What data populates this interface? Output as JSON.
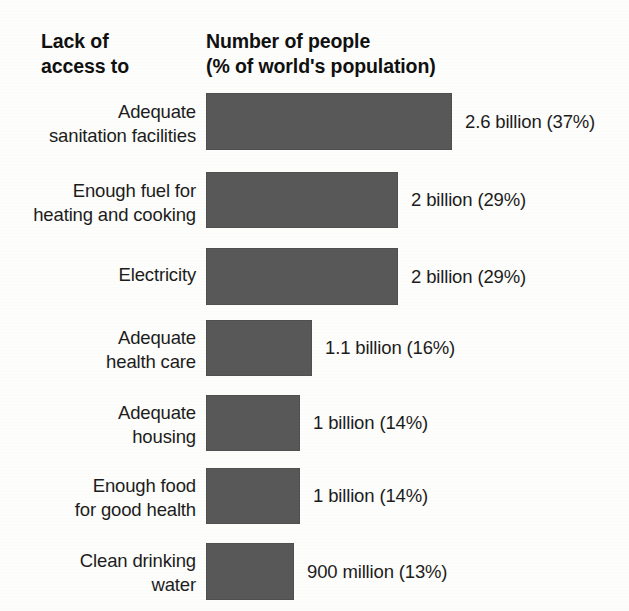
{
  "headers": {
    "left": "Lack of\naccess to",
    "right": "Number of people\n(% of world's population)"
  },
  "colors": {
    "bar": "#585858",
    "background": "#fdfdfb",
    "text": "#1c1c1c"
  },
  "chart_data": {
    "type": "bar",
    "orientation": "horizontal",
    "title": "Lack of access to",
    "xlabel": "Number of people (% of world's population)",
    "ylabel": "Lack of access to",
    "grid": false,
    "legend": null,
    "xlim": [
      0,
      3.0
    ],
    "value_unit": "billions of people",
    "categories": [
      "Adequate\nsanitation facilities",
      "Enough fuel for\nheating and cooking",
      "Electricity",
      "Adequate\nhealth care",
      "Adequate\nhousing",
      "Enough food\nfor good health",
      "Clean drinking\nwater"
    ],
    "values": [
      2.6,
      2.0,
      2.0,
      1.1,
      1.0,
      1.0,
      0.9
    ],
    "percents": [
      37,
      29,
      29,
      16,
      14,
      14,
      13
    ],
    "data_labels": [
      "2.6 billion (37%)",
      "2 billion (29%)",
      "2 billion (29%)",
      "1.1 billion (16%)",
      "1 billion (14%)",
      "1 billion (14%)",
      "900 million (13%)"
    ]
  },
  "rows": [
    {
      "label": "Adequate\nsanitation facilities",
      "value_label": "2.6 billion (37%)",
      "bar_width": 246,
      "top": 93,
      "height": 57,
      "label_top": 100
    },
    {
      "label": "Enough fuel for\nheating and cooking",
      "value_label": "2 billion (29%)",
      "bar_width": 192,
      "top": 172,
      "height": 56,
      "label_top": 179
    },
    {
      "label": "Electricity",
      "value_label": "2 billion (29%)",
      "bar_width": 192,
      "top": 248,
      "height": 57,
      "label_top": 263
    },
    {
      "label": "Adequate\nhealth care",
      "value_label": "1.1 billion (16%)",
      "bar_width": 106,
      "top": 320,
      "height": 56,
      "label_top": 326
    },
    {
      "label": "Adequate\nhousing",
      "value_label": "1 billion (14%)",
      "bar_width": 94,
      "top": 395,
      "height": 56,
      "label_top": 401
    },
    {
      "label": "Enough food\nfor good health",
      "value_label": "1 billion (14%)",
      "bar_width": 94,
      "top": 468,
      "height": 56,
      "label_top": 474
    },
    {
      "label": "Clean drinking\nwater",
      "value_label": "900 million (13%)",
      "bar_width": 88,
      "top": 543,
      "height": 57,
      "label_top": 549
    }
  ]
}
